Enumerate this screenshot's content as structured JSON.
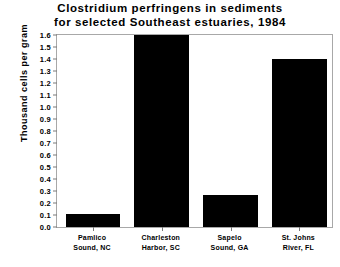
{
  "chart_data": {
    "type": "bar",
    "title": "Clostridium perfringens in sediments for selected Southeast estuaries, 1984",
    "title_lines": [
      "Clostridium perfringens in sediments",
      "for selected Southeast estuaries, 1984"
    ],
    "xlabel": "",
    "ylabel": "Thousand cells per gram",
    "ylim": [
      0.0,
      1.6
    ],
    "ytick_step": 0.1,
    "ytick_labels": [
      "0.0",
      "0.1",
      "0.2",
      "0.3",
      "0.4",
      "0.5",
      "0.6",
      "0.7",
      "0.8",
      "0.9",
      "1.0",
      "1.1",
      "1.2",
      "1.3",
      "1.4",
      "1.5",
      "1.6"
    ],
    "ytick_values": [
      0.0,
      0.1,
      0.2,
      0.3,
      0.4,
      0.5,
      0.6,
      0.7,
      0.8,
      0.9,
      1.0,
      1.1,
      1.2,
      1.3,
      1.4,
      1.5,
      1.6
    ],
    "categories": [
      "Pamlico Sound, NC",
      "Charleston Harbor, SC",
      "Sapelo Sound, GA",
      "St. Johns River, FL"
    ],
    "category_lines": [
      [
        "Pamlico",
        "Sound, NC"
      ],
      [
        "Charleston",
        "Harbor, SC"
      ],
      [
        "Sapelo",
        "Sound, GA"
      ],
      [
        "St. Johns",
        "River, FL"
      ]
    ],
    "values": [
      0.11,
      1.6,
      0.27,
      1.4
    ],
    "bar_color": "#000000",
    "grid": false,
    "legend": false
  }
}
